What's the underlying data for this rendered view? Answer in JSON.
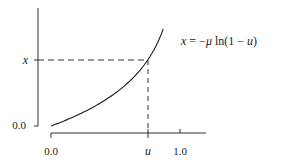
{
  "chart_data": {
    "type": "line",
    "title": "",
    "equation": "x = −μ ln(1 − u)",
    "equation_parts": {
      "lhs": "x",
      "eq": " = −",
      "mu": "μ",
      "rhs": " ln(1 − ",
      "u": "u",
      "close": ")"
    },
    "xlabel": "",
    "ylabel": "",
    "x_ticks": [
      {
        "label": "0.0",
        "value": 0.0
      },
      {
        "label": "u",
        "value": 0.75,
        "italic": true
      },
      {
        "label": "1.0",
        "value": 1.0
      }
    ],
    "y_ticks": [
      {
        "label": "0.0",
        "value": 0.0
      },
      {
        "label": "x",
        "value": 1.386,
        "italic": true
      }
    ],
    "series": [
      {
        "name": "x = −μ ln(1 − u)",
        "mu": 1.0,
        "x": [
          0.0,
          0.1,
          0.2,
          0.3,
          0.4,
          0.5,
          0.6,
          0.7,
          0.75,
          0.8,
          0.85,
          0.87
        ],
        "y": [
          0.0,
          0.105,
          0.223,
          0.357,
          0.511,
          0.693,
          0.916,
          1.204,
          1.386,
          1.609,
          1.897,
          2.04
        ]
      }
    ],
    "annotations": [
      {
        "type": "dashed-horizontal",
        "at_y": "x",
        "from_x": 0.0,
        "to_x": "u"
      },
      {
        "type": "dashed-vertical",
        "at_x": "u",
        "from_y": "x",
        "to_y": 0.0
      }
    ],
    "xlim": [
      0.0,
      1.2
    ],
    "grid": false,
    "legend": "none"
  },
  "labels": {
    "y_zero": "0.0",
    "y_x": "x",
    "x_zero": "0.0",
    "x_u": "u",
    "x_one": "1.0"
  },
  "colors": {
    "line": "#1a1a1a",
    "background": "#ffffff"
  }
}
